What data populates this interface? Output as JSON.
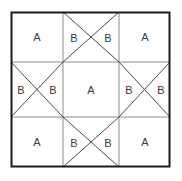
{
  "figure": {
    "title": "",
    "background_color": "#ffffff",
    "outer_border_color": "#1a1a1a",
    "grid_line_color": "#8c8c8c",
    "diagonal_line_color": "#4a4a4a",
    "label_color": "#3a3a3a",
    "outer": {
      "x": 11,
      "y": 12,
      "width": 159,
      "height": 155
    },
    "grid": {
      "columns": 3,
      "rows": 3,
      "x_dividers": [
        63,
        119
      ],
      "y_dividers": [
        62,
        117
      ]
    },
    "cells": [
      {
        "id": "top-left",
        "row": 0,
        "col": 0,
        "pattern": "plain",
        "labels": [
          {
            "text": "A",
            "x": 37,
            "y": 37
          }
        ]
      },
      {
        "id": "top-center",
        "row": 0,
        "col": 1,
        "pattern": "cross",
        "labels": [
          {
            "text": "B",
            "x": 74,
            "y": 38
          },
          {
            "text": "B",
            "x": 108,
            "y": 38
          }
        ]
      },
      {
        "id": "top-right",
        "row": 0,
        "col": 2,
        "pattern": "plain",
        "labels": [
          {
            "text": "A",
            "x": 145,
            "y": 37
          }
        ]
      },
      {
        "id": "middle-left",
        "row": 1,
        "col": 0,
        "pattern": "cross",
        "labels": [
          {
            "text": "B",
            "x": 21,
            "y": 90
          },
          {
            "text": "B",
            "x": 53,
            "y": 90
          }
        ]
      },
      {
        "id": "center",
        "row": 1,
        "col": 1,
        "pattern": "plain",
        "labels": [
          {
            "text": "A",
            "x": 91,
            "y": 90
          }
        ]
      },
      {
        "id": "middle-right",
        "row": 1,
        "col": 2,
        "pattern": "cross",
        "labels": [
          {
            "text": "B",
            "x": 129,
            "y": 90
          },
          {
            "text": "B",
            "x": 161,
            "y": 90
          }
        ]
      },
      {
        "id": "bottom-left",
        "row": 2,
        "col": 0,
        "pattern": "plain",
        "labels": [
          {
            "text": "A",
            "x": 37,
            "y": 142
          }
        ]
      },
      {
        "id": "bottom-center",
        "row": 2,
        "col": 1,
        "pattern": "cross",
        "labels": [
          {
            "text": "B",
            "x": 74,
            "y": 143
          },
          {
            "text": "B",
            "x": 108,
            "y": 143
          }
        ]
      },
      {
        "id": "bottom-right",
        "row": 2,
        "col": 2,
        "pattern": "plain",
        "labels": [
          {
            "text": "A",
            "x": 145,
            "y": 142
          }
        ]
      }
    ],
    "legend_letters": [
      "A",
      "B"
    ]
  }
}
